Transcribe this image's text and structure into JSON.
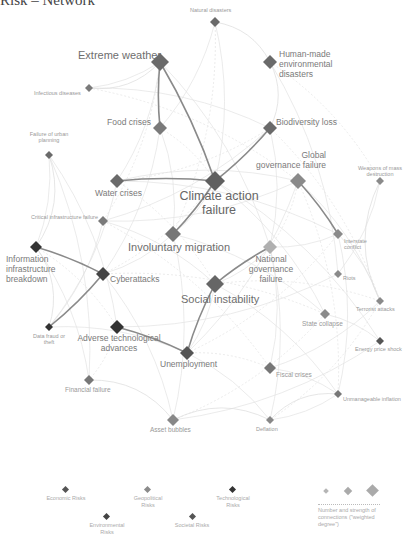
{
  "title": "Risk – Network",
  "nodes": [
    {
      "id": "natural_disasters",
      "label": "Natural disasters",
      "x": 215,
      "y": 22,
      "size": 5,
      "color": "#6a6a6a"
    },
    {
      "id": "extreme_weather",
      "label": "Extreme weather",
      "x": 160,
      "y": 62,
      "size": 9,
      "color": "#6a6a6a"
    },
    {
      "id": "human_made",
      "label": "Human-made environmental disasters",
      "x": 270,
      "y": 62,
      "size": 7,
      "color": "#6a6a6a"
    },
    {
      "id": "infectious",
      "label": "Infectious diseases",
      "x": 89,
      "y": 88,
      "size": 4,
      "color": "#7a7a7a"
    },
    {
      "id": "food_crises",
      "label": "Food crises",
      "x": 160,
      "y": 128,
      "size": 7,
      "color": "#7a7a7a"
    },
    {
      "id": "biodiversity",
      "label": "Biodiversity loss",
      "x": 270,
      "y": 128,
      "size": 7,
      "color": "#6a6a6a"
    },
    {
      "id": "urban_planning",
      "label": "Failure of urban planning",
      "x": 49,
      "y": 155,
      "size": 4,
      "color": "#6a6a6a"
    },
    {
      "id": "water_crises",
      "label": "Water crises",
      "x": 117,
      "y": 181,
      "size": 7,
      "color": "#6a6a6a"
    },
    {
      "id": "climate_action",
      "label": "Climate action failure",
      "x": 215,
      "y": 181,
      "size": 10,
      "color": "#5f5f5f"
    },
    {
      "id": "global_gov",
      "label": "Global governance failure",
      "x": 298,
      "y": 181,
      "size": 8,
      "color": "#8a8a8a"
    },
    {
      "id": "wmd",
      "label": "Weapons of mass destruction",
      "x": 380,
      "y": 181,
      "size": 4,
      "color": "#8a8a8a"
    },
    {
      "id": "critical_infra",
      "label": "Critical infrastructure failure",
      "x": 103,
      "y": 221,
      "size": 5,
      "color": "#7a7a7a"
    },
    {
      "id": "involuntary_migration",
      "label": "Involuntary migration",
      "x": 173,
      "y": 234,
      "size": 8,
      "color": "#777777"
    },
    {
      "id": "interstate",
      "label": "Interstate conflict",
      "x": 338,
      "y": 234,
      "size": 5,
      "color": "#8a8a8a"
    },
    {
      "id": "info_infra",
      "label": "Information infrastructure breakdown",
      "x": 36,
      "y": 247,
      "size": 6,
      "color": "#333333"
    },
    {
      "id": "national_gov",
      "label": "National governance failure",
      "x": 270,
      "y": 247,
      "size": 7,
      "color": "#b0b0b0"
    },
    {
      "id": "cyberattacks",
      "label": "Cyberattacks",
      "x": 103,
      "y": 274,
      "size": 7,
      "color": "#444444"
    },
    {
      "id": "social_instability",
      "label": "Social instability",
      "x": 215,
      "y": 284,
      "size": 9,
      "color": "#666666"
    },
    {
      "id": "riots",
      "label": "Riots",
      "x": 338,
      "y": 274,
      "size": 4,
      "color": "#8a8a8a"
    },
    {
      "id": "terrorist",
      "label": "Terrorist attacks",
      "x": 380,
      "y": 301,
      "size": 4,
      "color": "#8a8a8a"
    },
    {
      "id": "state_collapse",
      "label": "State collapse",
      "x": 325,
      "y": 314,
      "size": 5,
      "color": "#8a8a8a"
    },
    {
      "id": "data_fraud",
      "label": "Data fraud or theft",
      "x": 49,
      "y": 327,
      "size": 4,
      "color": "#333333"
    },
    {
      "id": "adverse_tech",
      "label": "Adverse technological advances",
      "x": 117,
      "y": 327,
      "size": 7,
      "color": "#333333"
    },
    {
      "id": "unemployment",
      "label": "Unemployment",
      "x": 187,
      "y": 353,
      "size": 7,
      "color": "#555555"
    },
    {
      "id": "energy_price",
      "label": "Energy price shock",
      "x": 380,
      "y": 341,
      "size": 4,
      "color": "#555555"
    },
    {
      "id": "fiscal",
      "label": "Fiscal crises",
      "x": 270,
      "y": 368,
      "size": 6,
      "color": "#777777"
    },
    {
      "id": "financial_failure",
      "label": "Financial failure",
      "x": 89,
      "y": 380,
      "size": 5,
      "color": "#777777"
    },
    {
      "id": "unmanageable_inflation",
      "label": "Unmanageable inflation",
      "x": 338,
      "y": 394,
      "size": 4,
      "color": "#777777"
    },
    {
      "id": "asset_bubbles",
      "label": "Asset bubbles",
      "x": 173,
      "y": 420,
      "size": 6,
      "color": "#888888"
    },
    {
      "id": "deflation",
      "label": "Deflation",
      "x": 270,
      "y": 420,
      "size": 4,
      "color": "#888888"
    }
  ],
  "strong_edges": [
    [
      "extreme_weather",
      "climate_action"
    ],
    [
      "biodiversity",
      "climate_action"
    ],
    [
      "info_infra",
      "cyberattacks"
    ],
    [
      "cyberattacks",
      "data_fraud"
    ],
    [
      "adverse_tech",
      "unemployment"
    ],
    [
      "unemployment",
      "social_instability"
    ],
    [
      "social_instability",
      "national_gov"
    ],
    [
      "global_gov",
      "interstate"
    ],
    [
      "water_crises",
      "climate_action"
    ],
    [
      "food_crises",
      "extreme_weather"
    ],
    [
      "climate_action",
      "involuntary_migration"
    ]
  ],
  "legend": {
    "categories": [
      {
        "label": "Economic Risks",
        "color": "#555555"
      },
      {
        "label": "Geopolitical Risks",
        "color": "#8a8a8a"
      },
      {
        "label": "Technological Risks",
        "color": "#333333"
      },
      {
        "label": "Environmental Risks",
        "color": "#444444"
      },
      {
        "label": "Societal Risks",
        "color": "#555555"
      }
    ],
    "size_caption": "Number and strength of connections (\"weighted degree\")"
  }
}
